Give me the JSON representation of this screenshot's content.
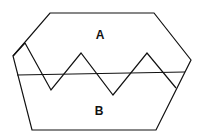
{
  "diagram": {
    "labels": {
      "region_a": "A",
      "region_b": "B"
    },
    "colors": {
      "stroke": "#111111",
      "background": "#ffffff"
    },
    "outer_shape": "irregular-hexagon",
    "divider": "horizontal-line",
    "boundary": "zigzag-line"
  }
}
